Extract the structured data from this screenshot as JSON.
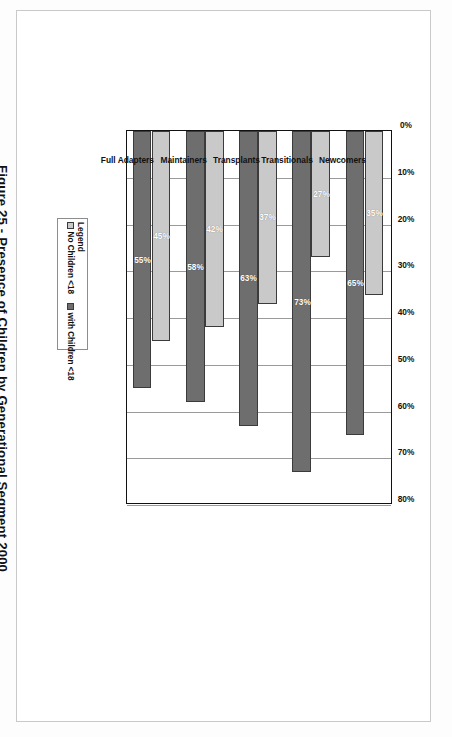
{
  "figure": {
    "caption": "Figure 25 - Presence of Children by Generational Segment 2000"
  },
  "legend": {
    "title": "Legend",
    "items": [
      {
        "label": "No Children <18",
        "color": "#c9c9c9",
        "swatch": "legend-swatch-no-children"
      },
      {
        "label": "with Children <18",
        "color": "#6e6e6e",
        "swatch": "legend-swatch-with-children"
      }
    ]
  },
  "chart_data": {
    "type": "bar",
    "orientation": "horizontal",
    "title": "Figure 25 - Presence of Children by Generational Segment 2000",
    "xlabel": "",
    "ylabel": "",
    "xlim": [
      0,
      80
    ],
    "grid": true,
    "legend_position": "left",
    "categories": [
      "Newcomers",
      "Transitionals",
      "Transplants",
      "Maintainers",
      "Full Adapters"
    ],
    "tick_labels": [
      "0%",
      "10%",
      "20%",
      "30%",
      "40%",
      "50%",
      "60%",
      "70%",
      "80%"
    ],
    "tick_values": [
      0,
      10,
      20,
      30,
      40,
      50,
      60,
      70,
      80
    ],
    "series": [
      {
        "name": "No Children <18",
        "color": "#c9c9c9",
        "values": [
          35,
          27,
          37,
          42,
          45
        ],
        "labels": [
          "35%",
          "27%",
          "37%",
          "42%",
          "45%"
        ]
      },
      {
        "name": "with Children <18",
        "color": "#6e6e6e",
        "values": [
          65,
          73,
          63,
          58,
          55
        ],
        "labels": [
          "65%",
          "73%",
          "63%",
          "58%",
          "55%"
        ]
      }
    ]
  }
}
